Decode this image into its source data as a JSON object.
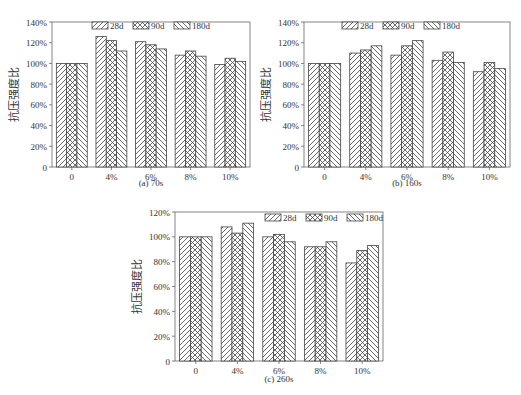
{
  "figure": {
    "ylabel": "抗压强度比",
    "legend": [
      "28d",
      "90d",
      "180d"
    ]
  },
  "chart_data": [
    {
      "type": "bar",
      "title": "(a) 70s",
      "xlabel": "",
      "ylabel": "抗压强度比",
      "categories": [
        "0",
        "4%",
        "6%",
        "8%",
        "10%"
      ],
      "yticks": [
        "0",
        "20%",
        "40%",
        "60%",
        "80%",
        "100%",
        "120%",
        "140%"
      ],
      "ylim": [
        0,
        140
      ],
      "legend_position": "top-center",
      "grid": false,
      "series": [
        {
          "name": "28d",
          "values": [
            100,
            126,
            121,
            108,
            99
          ]
        },
        {
          "name": "90d",
          "values": [
            100,
            122,
            118,
            112,
            105
          ]
        },
        {
          "name": "180d",
          "values": [
            100,
            112,
            114,
            107,
            102
          ]
        }
      ]
    },
    {
      "type": "bar",
      "title": "(b) 160s",
      "xlabel": "",
      "ylabel": "抗压强度比",
      "categories": [
        "0",
        "4%",
        "6%",
        "8%",
        "10%"
      ],
      "yticks": [
        "0",
        "20%",
        "40%",
        "60%",
        "80%",
        "100%",
        "120%",
        "140%"
      ],
      "ylim": [
        0,
        140
      ],
      "legend_position": "top-center",
      "grid": false,
      "series": [
        {
          "name": "28d",
          "values": [
            100,
            110,
            108,
            103,
            92
          ]
        },
        {
          "name": "90d",
          "values": [
            100,
            113,
            117,
            111,
            101
          ]
        },
        {
          "name": "180d",
          "values": [
            100,
            117,
            122,
            101,
            95
          ]
        }
      ]
    },
    {
      "type": "bar",
      "title": "(c) 260s",
      "xlabel": "",
      "ylabel": "抗压强度比",
      "categories": [
        "0",
        "4%",
        "6%",
        "8%",
        "10%"
      ],
      "yticks": [
        "0",
        "20%",
        "40%",
        "60%",
        "80%",
        "100%",
        "120%"
      ],
      "ylim": [
        0,
        120
      ],
      "legend_position": "top-right",
      "grid": false,
      "series": [
        {
          "name": "28d",
          "values": [
            100,
            108,
            100,
            92,
            79
          ]
        },
        {
          "name": "90d",
          "values": [
            100,
            103,
            102,
            92,
            89
          ]
        },
        {
          "name": "180d",
          "values": [
            100,
            111,
            96,
            96,
            93
          ]
        }
      ]
    }
  ]
}
